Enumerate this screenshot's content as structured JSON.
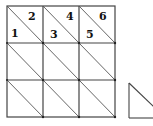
{
  "diagram": {
    "grid": {
      "rows": 3,
      "cols": 3,
      "diagonal": "top-left to bottom-right"
    },
    "labels": [
      "1",
      "2",
      "3",
      "4",
      "5",
      "6"
    ],
    "separate_shape": "right triangle"
  },
  "colors": {
    "line": "#333333",
    "background": "#ffffff"
  }
}
